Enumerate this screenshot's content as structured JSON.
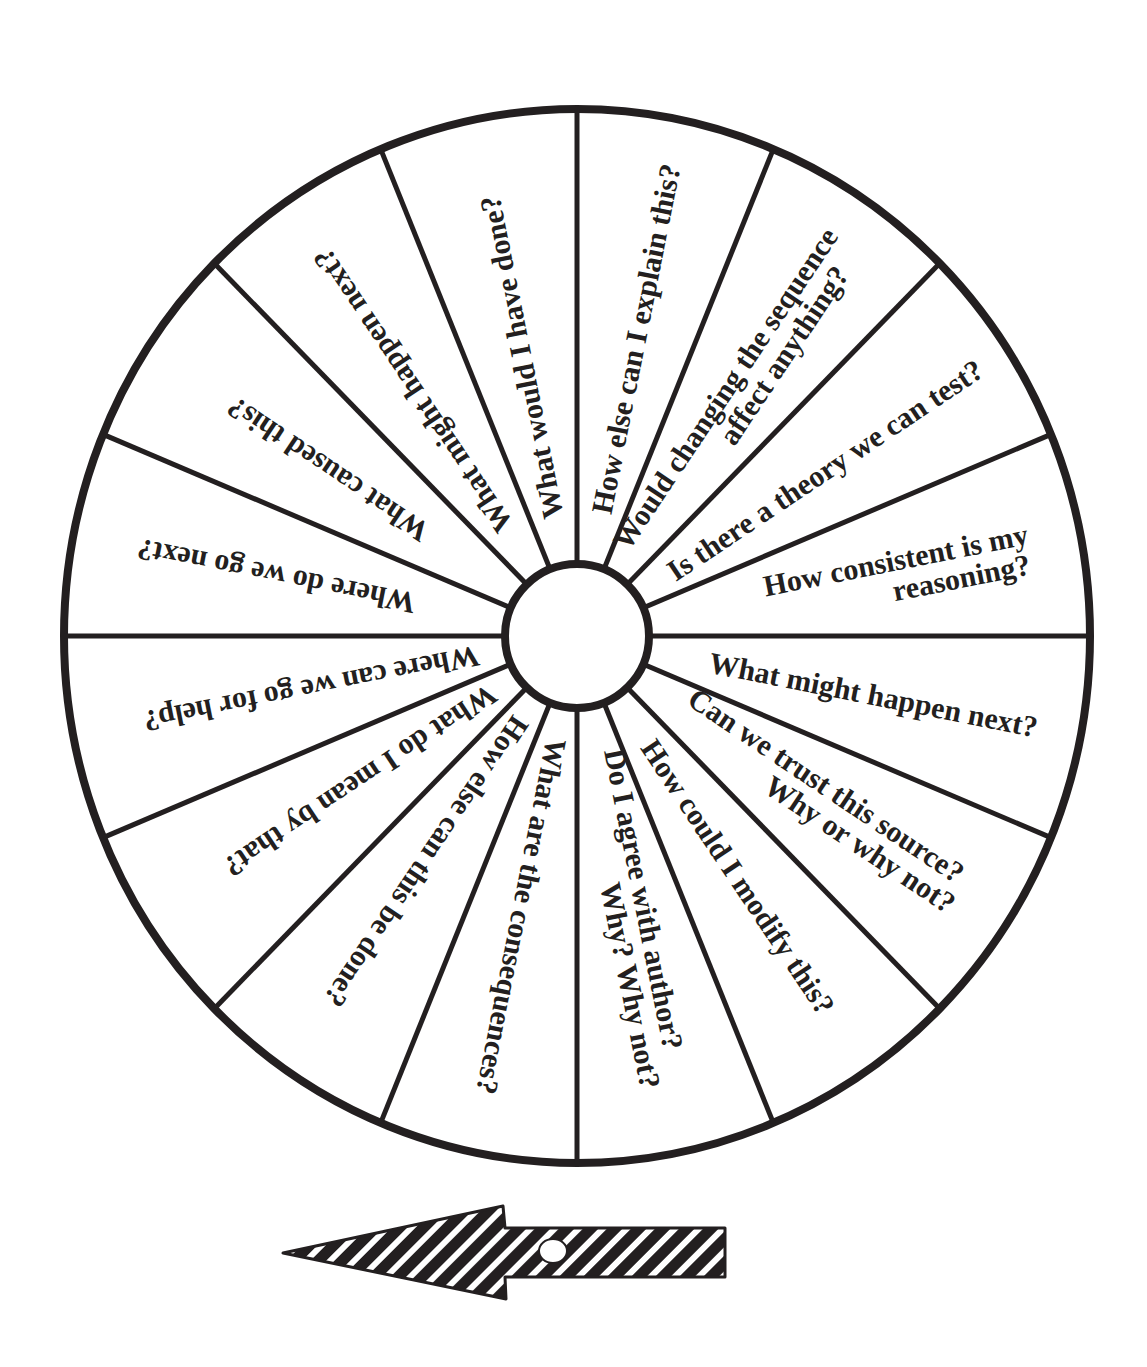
{
  "wheel": {
    "title": "Question wheel",
    "center": {
      "x": 577,
      "y": 636
    },
    "radius_x": 513,
    "radius_y": 527,
    "hub_radius": 72,
    "segment_count": 16,
    "line_color": "#231f20",
    "background": "#ffffff",
    "segments": [
      {
        "angle": -78.75,
        "lines": [
          {
            "text": "How else can I explain this?",
            "r": 125,
            "offset": 10,
            "anchor": "start"
          }
        ]
      },
      {
        "angle": -56.25,
        "lines": [
          {
            "text": "Would changing the sequence",
            "r": 478,
            "offset": -4,
            "anchor": "end"
          },
          {
            "text": "affect anything?",
            "r": 452,
            "offset": 26,
            "anchor": "end"
          }
        ]
      },
      {
        "angle": -33.75,
        "lines": [
          {
            "text": "Is there a theory we can test?",
            "r": 112,
            "offset": 10,
            "anchor": "start"
          }
        ]
      },
      {
        "angle": -11.25,
        "lines": [
          {
            "text": "How consistent is my",
            "r": 462,
            "offset": -2,
            "anchor": "end"
          },
          {
            "text": "reasoning?",
            "r": 458,
            "offset": 28,
            "anchor": "end"
          }
        ]
      },
      {
        "angle": 11.25,
        "lines": [
          {
            "text": "What might happen next?",
            "r": 135,
            "offset": 10,
            "anchor": "start"
          }
        ]
      },
      {
        "angle": 33.75,
        "lines": [
          {
            "text": "Can we trust this source?",
            "r": 128,
            "offset": -4,
            "anchor": "start"
          },
          {
            "text": "Why or why not?",
            "r": 462,
            "offset": 26,
            "anchor": "end"
          }
        ]
      },
      {
        "angle": 56.25,
        "lines": [
          {
            "text": "How could I modify this?",
            "r": 128,
            "offset": 10,
            "anchor": "start"
          }
        ]
      },
      {
        "angle": 78.75,
        "lines": [
          {
            "text": "Do I agree with author?",
            "r": 118,
            "offset": -4,
            "anchor": "start"
          },
          {
            "text": "Why?  Why not?",
            "r": 458,
            "offset": 26,
            "anchor": "end"
          }
        ]
      },
      {
        "angle": 101.25,
        "lines": [
          {
            "text": "What are the consequences?",
            "r": 105,
            "offset": 10,
            "anchor": "start"
          }
        ]
      },
      {
        "angle": 123.75,
        "lines": [
          {
            "text": "How else can this be done?",
            "r": 100,
            "offset": 10,
            "anchor": "start"
          }
        ]
      },
      {
        "angle": 146.25,
        "lines": [
          {
            "text": "What do I mean by that?",
            "r": 100,
            "offset": 10,
            "anchor": "start"
          }
        ]
      },
      {
        "angle": 168.75,
        "lines": [
          {
            "text": "Where can we go for help?",
            "r": 100,
            "offset": 10,
            "anchor": "start"
          }
        ]
      },
      {
        "angle": 191.25,
        "lines": [
          {
            "text": "Where do we go next?",
            "r": 165,
            "offset": 10,
            "anchor": "start"
          }
        ]
      },
      {
        "angle": 213.75,
        "lines": [
          {
            "text": "What caused this?",
            "r": 182,
            "offset": 10,
            "anchor": "start"
          }
        ]
      },
      {
        "angle": 236.25,
        "lines": [
          {
            "text": "What might happen next?",
            "r": 128,
            "offset": 10,
            "anchor": "start"
          }
        ]
      },
      {
        "angle": 258.75,
        "lines": [
          {
            "text": "What would I have done?",
            "r": 120,
            "offset": 10,
            "anchor": "start"
          }
        ]
      }
    ]
  },
  "spinner_arrow": {
    "direction": "left",
    "pattern": "diagonal-stripes",
    "fill": "#231f20",
    "stripe_color": "#ffffff"
  }
}
